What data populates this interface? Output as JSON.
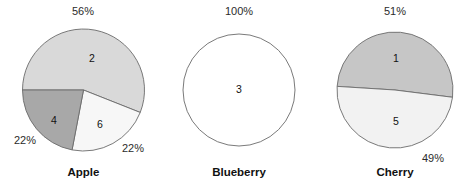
{
  "chart_data": {
    "type": "pie",
    "title": "",
    "subtitle": "",
    "xlabel": "",
    "ylabel": "",
    "legend_position": "none",
    "grid": false,
    "charts": [
      {
        "name": "Apple",
        "group_label": "Apple",
        "center_x": 83.5,
        "center_y": 90,
        "radius": 61,
        "start_angle_deg": 180,
        "direction": "clockwise",
        "slices": [
          {
            "id": "2",
            "slice_label": "2",
            "percent": 56,
            "pct_label": "56%",
            "color": "#d9d9d9",
            "label_x": 92,
            "label_y": 62,
            "pct_x": 83,
            "pct_y": 15
          },
          {
            "id": "6",
            "slice_label": "6",
            "percent": 22,
            "pct_label": "22%",
            "color": "#f7f7f7",
            "label_x": 100,
            "label_y": 128,
            "pct_x": 133,
            "pct_y": 152
          },
          {
            "id": "4",
            "slice_label": "4",
            "percent": 22,
            "pct_label": "22%",
            "color": "#a8a8a8",
            "label_x": 54,
            "label_y": 124,
            "pct_x": 25,
            "pct_y": 144
          }
        ]
      },
      {
        "name": "Blueberry",
        "group_label": "Blueberry",
        "center_x": 239,
        "center_y": 90,
        "radius": 56,
        "start_angle_deg": 180,
        "direction": "clockwise",
        "slices": [
          {
            "id": "3",
            "slice_label": "3",
            "percent": 100,
            "pct_label": "100%",
            "color": "#ffffff",
            "label_x": 239,
            "label_y": 93,
            "pct_x": 239,
            "pct_y": 15
          }
        ]
      },
      {
        "name": "Cherry",
        "group_label": "Cherry",
        "center_x": 395,
        "center_y": 90,
        "radius": 58,
        "start_angle_deg": 183.6,
        "direction": "clockwise",
        "slices": [
          {
            "id": "1",
            "slice_label": "1",
            "percent": 51,
            "pct_label": "51%",
            "color": "#c6c6c6",
            "label_x": 396,
            "label_y": 62,
            "pct_x": 395,
            "pct_y": 15
          },
          {
            "id": "5",
            "slice_label": "5",
            "percent": 49,
            "pct_label": "49%",
            "color": "#f2f2f2",
            "label_x": 396,
            "label_y": 125,
            "pct_x": 433,
            "pct_y": 162
          }
        ]
      }
    ],
    "group_label_y": 176,
    "categories": [
      "Apple",
      "Blueberry",
      "Cherry"
    ],
    "series": [
      {
        "name": "1",
        "values": [
          0,
          0,
          51
        ]
      },
      {
        "name": "2",
        "values": [
          56,
          0,
          0
        ]
      },
      {
        "name": "3",
        "values": [
          0,
          100,
          0
        ]
      },
      {
        "name": "4",
        "values": [
          22,
          0,
          0
        ]
      },
      {
        "name": "5",
        "values": [
          0,
          0,
          49
        ]
      },
      {
        "name": "6",
        "values": [
          22,
          0,
          0
        ]
      }
    ]
  },
  "colors": {
    "background": "#ffffff",
    "outline": "#6b6b6b",
    "text": "#111111"
  }
}
